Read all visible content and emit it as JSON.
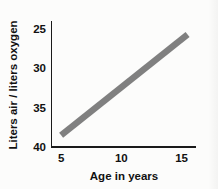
{
  "chart_data": {
    "type": "line",
    "title": "",
    "xlabel": "Age in years",
    "ylabel": "Liters air / liters oxygen",
    "xlim": [
      4.2,
      16.2
    ],
    "ylim": [
      40,
      24
    ],
    "y_axis_inverted": true,
    "grid": false,
    "legend": null,
    "xticks": [
      5,
      10,
      15
    ],
    "xtick_labels": [
      "5",
      "10",
      "15"
    ],
    "yticks": [
      25,
      30,
      35,
      40
    ],
    "ytick_labels": [
      "25",
      "30",
      "35",
      "40"
    ],
    "series": [
      {
        "name": "Liters air per liter oxygen vs age",
        "color": "#808080",
        "linewidth": 6.4,
        "x": [
          5.0,
          15.5
        ],
        "values": [
          38.5,
          25.7
        ]
      }
    ],
    "annotations": []
  },
  "figure": {
    "background_color": "#fcfcfb",
    "axis_color": "#1a1a1a",
    "accent_color": "#808080"
  }
}
